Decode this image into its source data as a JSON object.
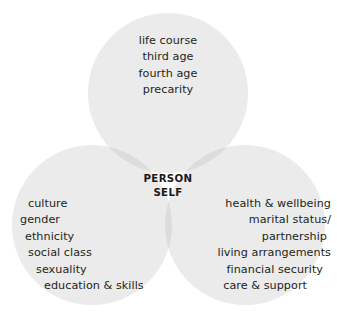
{
  "diagram": {
    "type": "venn-3-circle",
    "center": {
      "line1": "PERSON",
      "line2": "SELF"
    },
    "circles": [
      {
        "id": "top",
        "name": "life-course-circle",
        "position": "top",
        "items": [
          "life course",
          "third age",
          "fourth age",
          "precarity"
        ]
      },
      {
        "id": "left",
        "name": "social-identity-circle",
        "position": "bottom-left",
        "items": [
          "culture",
          "gender",
          "ethnicity",
          "social class",
          "sexuality",
          "education & skills"
        ]
      },
      {
        "id": "right",
        "name": "circumstances-circle",
        "position": "bottom-right",
        "items": [
          "health & wellbeing",
          "marital status/",
          "partnership",
          "living arrangements",
          "financial security",
          "care & support"
        ]
      }
    ],
    "colors": {
      "circle_fill": "#ebebeb",
      "pairwise_overlap": "#dcdcdc",
      "triple_overlap": "#cccccc",
      "text": "#231f20",
      "background": "#ffffff"
    },
    "geometry": {
      "top_circle": {
        "cx": 168,
        "cy": 93,
        "r": 80
      },
      "left_circle": {
        "cx": 92,
        "cy": 225,
        "r": 80
      },
      "right_circle": {
        "cx": 245,
        "cy": 225,
        "r": 80
      }
    }
  }
}
